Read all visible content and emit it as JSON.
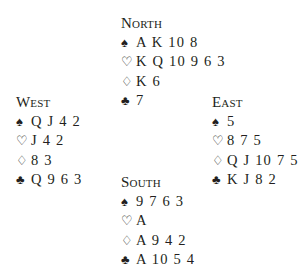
{
  "hands": {
    "north": {
      "label": "North",
      "spades": "A K 10 8",
      "hearts": "K Q 10 9 6 3",
      "diamonds": "K 6",
      "clubs": "7"
    },
    "west": {
      "label": "West",
      "spades": "Q J 4 2",
      "hearts": "J 4 2",
      "diamonds": "8 3",
      "clubs": "Q 9 6 3"
    },
    "east": {
      "label": "East",
      "spades": "5",
      "hearts": "8 7 5",
      "diamonds": "Q J 10 7 5",
      "clubs": "K J 8 2"
    },
    "south": {
      "label": "South",
      "spades": "9 7 6 3",
      "hearts": "A",
      "diamonds": "A 9 4 2",
      "clubs": "A 10 5 4"
    }
  },
  "suit_symbols": {
    "spades": "♠",
    "hearts": "♡",
    "diamonds": "♢",
    "clubs": "♣"
  }
}
